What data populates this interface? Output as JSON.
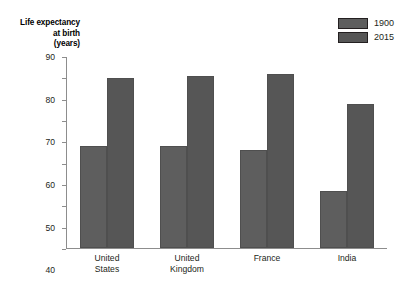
{
  "chart_data": {
    "type": "bar",
    "title": "",
    "subtitle": "",
    "xlabel": "",
    "ylabel": "Life expectancy at birth (years)",
    "ylabel_lines": [
      "Life expectancy",
      "at birth",
      "(years)"
    ],
    "categories": [
      "United States",
      "United Kingdom",
      "France",
      "India"
    ],
    "category_lines": [
      [
        "United",
        "States"
      ],
      [
        "United",
        "Kingdom"
      ],
      [
        "France",
        ""
      ],
      [
        "India",
        ""
      ]
    ],
    "series": [
      {
        "name": "1900",
        "values": [
          48,
          48,
          46,
          27
        ],
        "color": "#5e5e5e"
      },
      {
        "name": "2015",
        "values": [
          80,
          81,
          82,
          68
        ],
        "color": "#565656"
      }
    ],
    "ylim": [
      0,
      90
    ],
    "ytick_step": 10,
    "yticks": [
      0,
      10,
      20,
      30,
      40,
      50,
      60,
      70,
      80,
      90
    ],
    "ytick_labels": [
      "0",
      "10",
      "20",
      "30",
      "40",
      "50",
      "60",
      "70",
      "80",
      "90"
    ],
    "grid": false,
    "legend_position": "top-right"
  },
  "legend": {
    "items": [
      {
        "label": "1900",
        "color": "#5e5e5e"
      },
      {
        "label": "2015",
        "color": "#565656"
      }
    ]
  },
  "colors": {
    "axis": "#8d8d8d",
    "text": "#231f20",
    "background": "#ffffff",
    "bar_border": "#4f4f4f"
  }
}
